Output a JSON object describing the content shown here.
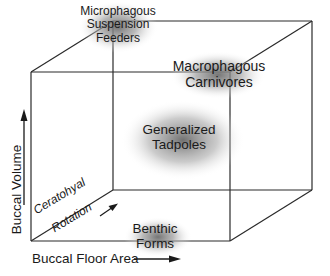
{
  "diagram": {
    "type": "3d-cube-morphospace",
    "axes": {
      "x": {
        "label": "Buccal Floor Area",
        "direction": "right"
      },
      "y": {
        "label": "Buccal Volume",
        "direction": "up"
      },
      "z": {
        "label_line1": "Ceratohyal",
        "label_line2": "Rotation",
        "direction": "back"
      }
    },
    "nodes": [
      {
        "id": "microphagous",
        "line1": "Microphagous",
        "line2": "Suspension",
        "line3": "Feeders",
        "position": "back-top-left"
      },
      {
        "id": "macrophagous",
        "line1": "Macrophagous",
        "line2": "Carnivores",
        "position": "front-top-right"
      },
      {
        "id": "generalized",
        "line1": "Generalized",
        "line2": "Tadpoles",
        "position": "center"
      },
      {
        "id": "benthic",
        "line1": "Benthic",
        "line2": "Forms",
        "position": "front-bottom-mid"
      }
    ],
    "colors": {
      "line": "#2a2a2a",
      "halo": "#7a7a7a",
      "background": "#ffffff"
    }
  }
}
